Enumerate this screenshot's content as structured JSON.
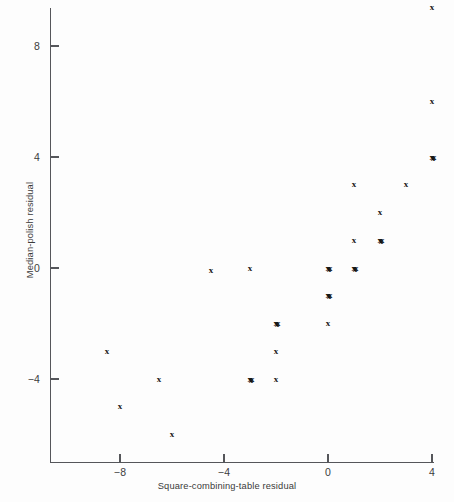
{
  "chart_data": {
    "type": "scatter",
    "title": "",
    "xlabel": "Square-combining-table residual",
    "ylabel": "Median-polish residual",
    "xlim": [
      -9.6,
      4.2
    ],
    "ylim": [
      -6.6,
      9.9
    ],
    "xticks": [
      -8,
      -4,
      0,
      4
    ],
    "xticklabels": [
      "-8",
      "-4",
      "0",
      "4"
    ],
    "yticks": [
      -4,
      0,
      4,
      8
    ],
    "yticklabels": [
      "-4",
      "0",
      "4",
      "8"
    ],
    "grid": false,
    "legend": null,
    "marker": "x",
    "marker_color": "#141414",
    "axis_color": "#55565a",
    "background": "#fdfdfd",
    "points": [
      {
        "x": 4,
        "y": 9.4,
        "count": 1
      },
      {
        "x": 4,
        "y": 6,
        "count": 1
      },
      {
        "x": 4,
        "y": 4,
        "count": 2
      },
      {
        "x": 3,
        "y": 3,
        "count": 1
      },
      {
        "x": 1,
        "y": 3,
        "count": 1
      },
      {
        "x": 2,
        "y": 2,
        "count": 1
      },
      {
        "x": 2,
        "y": 1,
        "count": 2
      },
      {
        "x": 1,
        "y": 1,
        "count": 1
      },
      {
        "x": 1,
        "y": 0,
        "count": 2
      },
      {
        "x": 0,
        "y": 0,
        "count": 2
      },
      {
        "x": -3,
        "y": 0,
        "count": 1
      },
      {
        "x": -4.5,
        "y": -0.1,
        "count": 1
      },
      {
        "x": 0,
        "y": -1,
        "count": 2
      },
      {
        "x": -2,
        "y": -2,
        "count": 2
      },
      {
        "x": 0,
        "y": -2,
        "count": 1
      },
      {
        "x": -2,
        "y": -3,
        "count": 1
      },
      {
        "x": -8.5,
        "y": -3,
        "count": 1
      },
      {
        "x": -3,
        "y": -4,
        "count": 2
      },
      {
        "x": -2,
        "y": -4,
        "count": 1
      },
      {
        "x": -6.5,
        "y": -4,
        "count": 1
      },
      {
        "x": -8,
        "y": -5,
        "count": 1
      },
      {
        "x": -6,
        "y": -6,
        "count": 1
      }
    ]
  }
}
